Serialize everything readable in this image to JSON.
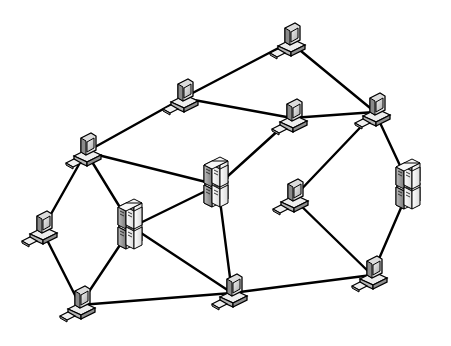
{
  "diagram": {
    "title": "",
    "type": "mesh-network",
    "colors": {
      "background": "#ffffff",
      "link": "#000000",
      "device_light": "#f2f2f2",
      "device_mid": "#c8c8c8",
      "device_dark": "#8a8a8a"
    },
    "nodes": [
      {
        "id": "pc-top",
        "kind": "workstation",
        "x": 290,
        "y": 42
      },
      {
        "id": "pc-upper-left",
        "kind": "workstation",
        "x": 183,
        "y": 98
      },
      {
        "id": "pc-upper-mid",
        "kind": "workstation",
        "x": 292,
        "y": 118
      },
      {
        "id": "pc-upper-right",
        "kind": "workstation",
        "x": 375,
        "y": 112
      },
      {
        "id": "pc-left",
        "kind": "workstation",
        "x": 86,
        "y": 152
      },
      {
        "id": "server-center",
        "kind": "server",
        "x": 218,
        "y": 185
      },
      {
        "id": "server-left",
        "kind": "server",
        "x": 132,
        "y": 227
      },
      {
        "id": "server-right",
        "kind": "server",
        "x": 410,
        "y": 187
      },
      {
        "id": "pc-mid-right",
        "kind": "workstation",
        "x": 293,
        "y": 198
      },
      {
        "id": "pc-far-left",
        "kind": "workstation",
        "x": 42,
        "y": 230
      },
      {
        "id": "pc-bottom-left",
        "kind": "workstation",
        "x": 80,
        "y": 305
      },
      {
        "id": "pc-bottom-mid",
        "kind": "workstation",
        "x": 232,
        "y": 293
      },
      {
        "id": "pc-bottom-right",
        "kind": "workstation",
        "x": 372,
        "y": 275
      }
    ],
    "links": [
      [
        "pc-upper-left",
        "pc-top"
      ],
      [
        "pc-top",
        "pc-upper-right"
      ],
      [
        "pc-upper-left",
        "pc-upper-mid"
      ],
      [
        "pc-upper-mid",
        "pc-upper-right"
      ],
      [
        "pc-upper-left",
        "pc-left"
      ],
      [
        "pc-left",
        "server-center"
      ],
      [
        "pc-upper-mid",
        "server-center"
      ],
      [
        "pc-left",
        "server-left"
      ],
      [
        "pc-left",
        "pc-far-left"
      ],
      [
        "server-center",
        "server-left"
      ],
      [
        "server-center",
        "pc-bottom-mid"
      ],
      [
        "pc-upper-right",
        "pc-mid-right"
      ],
      [
        "pc-upper-right",
        "server-right"
      ],
      [
        "pc-mid-right",
        "pc-bottom-right"
      ],
      [
        "server-right",
        "pc-bottom-right"
      ],
      [
        "pc-far-left",
        "pc-bottom-left"
      ],
      [
        "server-left",
        "pc-bottom-left"
      ],
      [
        "server-left",
        "pc-bottom-mid"
      ],
      [
        "pc-bottom-left",
        "pc-bottom-mid"
      ],
      [
        "pc-bottom-mid",
        "pc-bottom-right"
      ]
    ]
  }
}
